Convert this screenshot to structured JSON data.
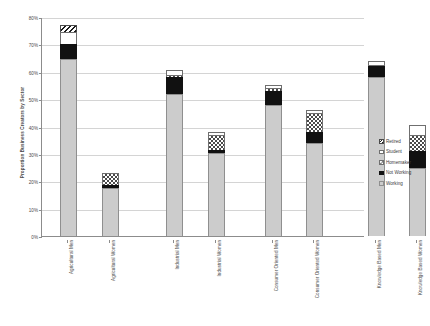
{
  "chart_data": {
    "type": "bar",
    "subtype": "stacked-vertical",
    "title": "",
    "xlabel": "",
    "ylabel": "Proportion Business Creators by Sector",
    "ylim": [
      0,
      80
    ],
    "ytick_labels": [
      "0%",
      "10%",
      "20%",
      "30%",
      "40%",
      "50%",
      "60%",
      "70%",
      "80%"
    ],
    "ytick_values": [
      0,
      10,
      20,
      30,
      40,
      50,
      60,
      70,
      80
    ],
    "grid": true,
    "legend_position": "right",
    "units": "percent",
    "categories": [
      "Agricultural Men",
      "Agricultural Women",
      "Industrial Men",
      "Industrial Women",
      "Consumer Oriented Men",
      "Consumer Oriented Women",
      "Knowledge Based Men",
      "Knowledge Based Women"
    ],
    "series": [
      {
        "name": "Working",
        "values": [
          64.5,
          17.5,
          52.0,
          30.5,
          48.0,
          34.0,
          58.0,
          25.0
        ]
      },
      {
        "name": "Not Working",
        "values": [
          5.5,
          1.0,
          6.0,
          1.0,
          5.0,
          4.0,
          4.0,
          6.0
        ]
      },
      {
        "name": "Homemaker",
        "values": [
          0.0,
          4.5,
          1.0,
          5.5,
          1.0,
          7.0,
          0.5,
          6.0
        ]
      },
      {
        "name": "Student",
        "values": [
          4.5,
          0.0,
          1.5,
          1.0,
          1.0,
          1.0,
          1.5,
          3.5
        ]
      },
      {
        "name": "Retired",
        "values": [
          2.5,
          0.0,
          0.0,
          0.0,
          0.0,
          0.0,
          0.0,
          0.0
        ]
      }
    ],
    "totals": [
      77.0,
      23.0,
      60.5,
      38.0,
      55.0,
      46.0,
      64.0,
      40.5
    ],
    "legend": [
      {
        "label": "Retired",
        "key": "retired"
      },
      {
        "label": "Student",
        "key": "student"
      },
      {
        "label": "Homemaker",
        "key": "homemaker"
      },
      {
        "label": "Not Working",
        "key": "notworking"
      },
      {
        "label": "Working",
        "key": "working"
      }
    ],
    "colors": {
      "working": "#cccccc",
      "notworking": "#111111",
      "homemaker": "#ffffff",
      "student": "#ffffff",
      "retired": "#ffffff",
      "gridline": "#d4d4d4",
      "axis": "#8c8c8c",
      "text": "#3a3a3a",
      "background": "#ffffff"
    }
  }
}
